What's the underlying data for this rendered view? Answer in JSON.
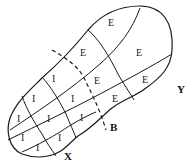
{
  "diagram": {
    "boundary_label": "B",
    "end_labels": {
      "left_end": "X",
      "right_end": "Y"
    },
    "cells": [
      {
        "label": "E",
        "x": 108,
        "y": 22
      },
      {
        "label": "E",
        "x": 80,
        "y": 52
      },
      {
        "label": "E",
        "x": 139,
        "y": 52
      },
      {
        "label": "E",
        "x": 96,
        "y": 80
      },
      {
        "label": "E",
        "x": 145,
        "y": 80
      },
      {
        "label": "E",
        "x": 115,
        "y": 98
      },
      {
        "label": "I",
        "x": 53,
        "y": 78
      },
      {
        "label": "I",
        "x": 34,
        "y": 98
      },
      {
        "label": "I",
        "x": 72,
        "y": 98
      },
      {
        "label": "I",
        "x": 19,
        "y": 118
      },
      {
        "label": "I",
        "x": 49,
        "y": 118
      },
      {
        "label": "I",
        "x": 82,
        "y": 118
      },
      {
        "label": "I",
        "x": 23,
        "y": 137
      },
      {
        "label": "I",
        "x": 60,
        "y": 137
      },
      {
        "label": "I",
        "x": 38,
        "y": 147
      }
    ],
    "colors": {
      "line": "#1a1a1a",
      "background": "#ffffff"
    }
  }
}
